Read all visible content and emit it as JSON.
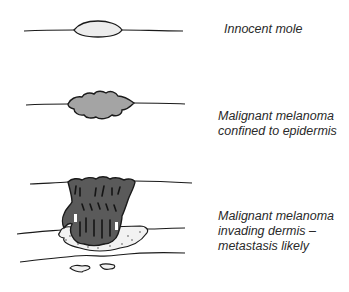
{
  "figure": {
    "stages": [
      {
        "id": "innocent-mole",
        "label_lines": [
          "Innocent mole"
        ],
        "fill": "#ececec"
      },
      {
        "id": "melanoma-epidermis",
        "label_lines": [
          "Malignant melanoma",
          "confined to epidermis"
        ],
        "fill": "#a4a4a4"
      },
      {
        "id": "melanoma-dermis",
        "label_lines": [
          "Malignant melanoma",
          "invading dermis –",
          "metastasis likely"
        ],
        "fill": "#5a5a5a"
      }
    ],
    "colors": {
      "outline": "#1a1a1a",
      "background": "#ffffff",
      "text": "#2a2a2a"
    }
  }
}
